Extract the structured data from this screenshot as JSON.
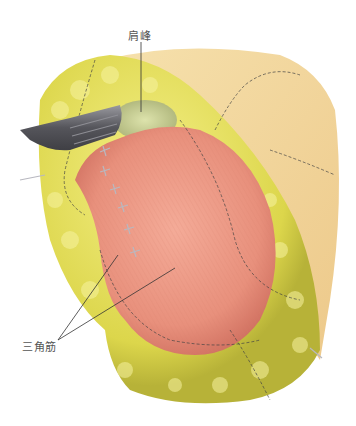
{
  "figure": {
    "labels": {
      "acromion": "肩峰",
      "deltoid": "三角筋"
    },
    "colors": {
      "muscle": "#e99683",
      "muscle_dark": "#c96c5c",
      "fat": "#e6e05a",
      "fat_dark": "#b9b43a",
      "skin": "#f5dca6",
      "acromion_bone": "#c5cc8e",
      "retractor": "#6b6b70",
      "suture": "#b8b8c0",
      "leader_line": "#333333"
    }
  }
}
